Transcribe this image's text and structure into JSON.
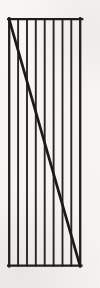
{
  "figure": {
    "canvas": {
      "width": 100,
      "height": 288
    },
    "colors": {
      "paper": "#f6f5f1",
      "edge_stroke": "#1e1e1e",
      "hatch_stroke": "#262626",
      "diagonal_stroke": "#1a1a1a"
    },
    "rect": {
      "left": 9.2,
      "top": 19.2,
      "right": 80.2,
      "bottom": 265.6
    },
    "edge_overshoot": {
      "top_right": 2.0,
      "bottom_right": 1.2,
      "left_bottom": 0.8
    },
    "hatch_lines_x": [
      18.1,
      27.0,
      35.8,
      44.7,
      53.6,
      62.5,
      71.3
    ],
    "diagonal": {
      "x1": 9.4,
      "y1": 20.2,
      "x2": 79.8,
      "y2": 265.2
    },
    "stroke_widths": {
      "edges": 2.3,
      "hatch": 1.9,
      "diagonal": 2.7
    }
  }
}
